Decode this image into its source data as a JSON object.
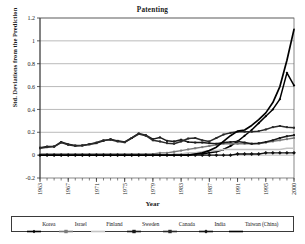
{
  "chart_data": {
    "type": "line",
    "title": "Patenting",
    "xlabel": "Year",
    "ylabel": "Std. Deviations from the Prediction",
    "ylim": [
      -0.2,
      1.2
    ],
    "ytick_step": 0.2,
    "yticks": [
      "-0.2",
      "0",
      "0.2",
      "0.4",
      "0.6",
      "0.8",
      "1",
      "1.2"
    ],
    "xlim": [
      1963,
      1999
    ],
    "xticks": [
      "1963",
      "1967",
      "1971",
      "1975",
      "1979",
      "1983",
      "1987",
      "1991",
      "1995",
      "2000"
    ],
    "xtick_years": [
      1963,
      1967,
      1971,
      1975,
      1979,
      1983,
      1987,
      1991,
      1995,
      1999
    ],
    "grid": true,
    "legend_position": "bottom",
    "x": [
      1963,
      1964,
      1965,
      1966,
      1967,
      1968,
      1969,
      1970,
      1971,
      1972,
      1973,
      1974,
      1975,
      1976,
      1977,
      1978,
      1979,
      1980,
      1981,
      1982,
      1983,
      1984,
      1985,
      1986,
      1987,
      1988,
      1989,
      1990,
      1991,
      1992,
      1993,
      1994,
      1995,
      1996,
      1997,
      1998,
      1999
    ],
    "series": [
      {
        "name": "Korea",
        "color": "#000000",
        "marker": "diamond",
        "width": 1.5,
        "values": [
          0.0,
          0.0,
          0.0,
          0.0,
          0.0,
          0.0,
          0.0,
          0.0,
          0.0,
          0.0,
          0.0,
          0.0,
          0.0,
          0.0,
          0.0,
          0.0,
          0.0,
          0.0,
          0.0,
          0.0,
          0.0,
          0.0,
          0.01,
          0.01,
          0.02,
          0.03,
          0.05,
          0.08,
          0.12,
          0.17,
          0.22,
          0.28,
          0.34,
          0.4,
          0.49,
          0.72,
          0.61
        ]
      },
      {
        "name": "Israel",
        "color": "#7a7a7a",
        "marker": "square",
        "width": 1.4,
        "values": [
          0.01,
          0.01,
          0.01,
          0.01,
          0.01,
          0.01,
          0.01,
          0.01,
          0.01,
          0.01,
          0.01,
          0.01,
          0.01,
          0.01,
          0.01,
          0.01,
          0.01,
          0.02,
          0.02,
          0.03,
          0.04,
          0.05,
          0.06,
          0.07,
          0.08,
          0.09,
          0.1,
          0.1,
          0.1,
          0.1,
          0.1,
          0.1,
          0.11,
          0.12,
          0.13,
          0.14,
          0.15
        ]
      },
      {
        "name": "Finland",
        "color": "#c4c4c4",
        "marker": "none",
        "width": 1.6,
        "values": [
          0.0,
          0.0,
          0.0,
          0.0,
          0.0,
          0.0,
          0.0,
          0.0,
          0.0,
          0.0,
          0.0,
          0.0,
          0.0,
          0.0,
          0.0,
          0.0,
          0.0,
          0.0,
          0.0,
          0.01,
          0.01,
          0.02,
          0.02,
          0.03,
          0.04,
          0.04,
          0.05,
          0.05,
          0.05,
          0.05,
          0.05,
          0.05,
          0.05,
          0.05,
          0.05,
          0.06,
          0.06
        ]
      },
      {
        "name": "Sweden",
        "color": "#1a1a1a",
        "marker": "square",
        "width": 1.5,
        "values": [
          0.065,
          0.075,
          0.075,
          0.115,
          0.095,
          0.085,
          0.085,
          0.095,
          0.105,
          0.125,
          0.14,
          0.125,
          0.115,
          0.15,
          0.19,
          0.175,
          0.14,
          0.155,
          0.125,
          0.12,
          0.135,
          0.115,
          0.11,
          0.11,
          0.105,
          0.1,
          0.11,
          0.115,
          0.12,
          0.11,
          0.1,
          0.105,
          0.115,
          0.13,
          0.15,
          0.165,
          0.175
        ]
      },
      {
        "name": "Canada",
        "color": "#2a2a2a",
        "marker": "square",
        "width": 1.5,
        "values": [
          0.06,
          0.07,
          0.075,
          0.11,
          0.09,
          0.08,
          0.085,
          0.095,
          0.11,
          0.13,
          0.135,
          0.12,
          0.112,
          0.15,
          0.185,
          0.17,
          0.13,
          0.12,
          0.105,
          0.1,
          0.12,
          0.145,
          0.15,
          0.13,
          0.12,
          0.15,
          0.18,
          0.195,
          0.205,
          0.205,
          0.205,
          0.21,
          0.225,
          0.245,
          0.255,
          0.245,
          0.24
        ]
      },
      {
        "name": "India",
        "color": "#111111",
        "marker": "diamond-big",
        "width": 1.4,
        "values": [
          0.0,
          0.0,
          0.0,
          0.0,
          0.0,
          0.0,
          0.0,
          0.0,
          0.0,
          0.0,
          0.0,
          0.0,
          0.0,
          0.0,
          0.0,
          0.0,
          0.0,
          0.0,
          0.0,
          0.0,
          0.0,
          0.0,
          0.0,
          0.0,
          0.0,
          0.0,
          0.0,
          0.0,
          0.01,
          0.01,
          0.01,
          0.01,
          0.02,
          0.02,
          0.02,
          0.02,
          0.02
        ]
      },
      {
        "name": "Taiwan (China)",
        "color": "#000000",
        "marker": "none",
        "width": 1.7,
        "values": [
          0.0,
          0.0,
          0.0,
          0.0,
          0.0,
          0.0,
          0.0,
          0.0,
          0.0,
          0.0,
          0.0,
          0.0,
          0.0,
          0.0,
          0.0,
          0.0,
          0.0,
          0.0,
          0.0,
          0.0,
          0.0,
          0.0,
          0.01,
          0.02,
          0.04,
          0.07,
          0.12,
          0.17,
          0.21,
          0.22,
          0.26,
          0.31,
          0.37,
          0.46,
          0.6,
          0.83,
          1.1
        ]
      }
    ]
  }
}
